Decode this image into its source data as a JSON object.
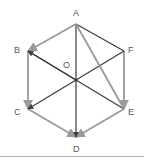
{
  "figure": {
    "canvas": {
      "width": 144,
      "height": 161
    },
    "background_color": "#ffffff",
    "colors": {
      "dark_edge": "#3c3c3c",
      "light_edge": "#9a9a9a",
      "label_text": "#5a5a5a",
      "rule": "#b4b4b4"
    },
    "vertices": [
      {
        "id": "A",
        "label": "A",
        "x": 76,
        "y": 24,
        "label_x": 73,
        "label_y": 9
      },
      {
        "id": "B",
        "label": "B",
        "x": 28,
        "y": 51,
        "label_x": 14,
        "label_y": 46
      },
      {
        "id": "C",
        "label": "C",
        "x": 28,
        "y": 109,
        "label_x": 14,
        "label_y": 108
      },
      {
        "id": "D",
        "label": "D",
        "x": 76,
        "y": 137,
        "label_x": 73,
        "label_y": 145
      },
      {
        "id": "E",
        "label": "E",
        "x": 124,
        "y": 109,
        "label_x": 128,
        "label_y": 108
      },
      {
        "id": "F",
        "label": "F",
        "x": 124,
        "y": 51,
        "label_x": 128,
        "label_y": 46
      },
      {
        "id": "O",
        "label": "O",
        "x": 76,
        "y": 80,
        "label_x": 63,
        "label_y": 61
      }
    ],
    "edges": [
      {
        "id": "A-B",
        "from": "A",
        "to": "B",
        "style": "light",
        "arrow": "end"
      },
      {
        "id": "B-C",
        "from": "B",
        "to": "C",
        "style": "light",
        "arrow": "end"
      },
      {
        "id": "C-D",
        "from": "C",
        "to": "D",
        "style": "light",
        "arrow": "end"
      },
      {
        "id": "A-F",
        "from": "A",
        "to": "F",
        "style": "dark",
        "arrow": "none"
      },
      {
        "id": "F-E",
        "from": "F",
        "to": "E",
        "style": "light",
        "arrow": "end"
      },
      {
        "id": "E-D",
        "from": "E",
        "to": "D",
        "style": "light",
        "arrow": "end"
      },
      {
        "id": "A-D",
        "from": "A",
        "to": "D",
        "style": "dark",
        "arrow": "end"
      },
      {
        "id": "B-E",
        "from": "B",
        "to": "E",
        "style": "dark",
        "arrow": "start"
      },
      {
        "id": "C-F",
        "from": "C",
        "to": "F",
        "style": "dark",
        "arrow": "start"
      },
      {
        "id": "A-E",
        "from": "A",
        "to": "E",
        "style": "light",
        "arrow": "none"
      },
      {
        "id": "B-O",
        "from": "B",
        "to": "O",
        "style": "dark",
        "arrow": "none"
      }
    ],
    "bottom_rule": {
      "y": 156
    }
  }
}
